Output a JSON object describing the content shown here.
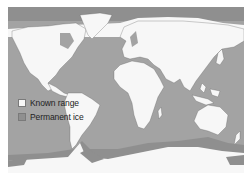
{
  "map": {
    "colors": {
      "ocean": "#a3a3a3",
      "known_range": "#f7f7f7",
      "permanent_ice": "#8f8f8f",
      "outline": "#555555"
    }
  },
  "legend": {
    "items": [
      {
        "label": "Known range",
        "color": "#f7f7f7"
      },
      {
        "label": "Permanent ice",
        "color": "#8f8f8f"
      }
    ]
  }
}
